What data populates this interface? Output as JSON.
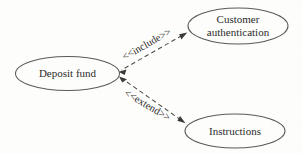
{
  "diagram": {
    "type": "uml-use-case-diagram",
    "background_color": "#fdfdfc",
    "stroke_color": "#5a5a58",
    "text_color": "#2b2b2b",
    "use_cases": [
      {
        "id": "deposit-fund",
        "label": "Deposit fund",
        "lines": [
          "Deposit fund"
        ],
        "cx": 67.5,
        "cy": 73.5,
        "rx": 52,
        "ry": 17
      },
      {
        "id": "customer-authentication",
        "label": "Customer authentication",
        "lines": [
          "Customer",
          "authentication"
        ],
        "cx": 238,
        "cy": 26,
        "rx": 50,
        "ry": 18
      },
      {
        "id": "instructions",
        "label": "Instructions",
        "lines": [
          "Instructions"
        ],
        "cx": 235,
        "cy": 131,
        "rx": 50,
        "ry": 17
      }
    ],
    "relationships": [
      {
        "id": "include-relationship",
        "stereotype": "<<include>>",
        "from": "customer-authentication",
        "to": "deposit-fund",
        "x1": 188,
        "y1": 32,
        "x2": 118,
        "y2": 72,
        "label_x": 146,
        "label_y": 45,
        "label_rotation": -30
      },
      {
        "id": "extend-relationship",
        "stereotype": "<<extend>>",
        "from": "instructions",
        "to": "deposit-fund",
        "x1": 186,
        "y1": 123,
        "x2": 119,
        "y2": 78,
        "label_x": 146,
        "label_y": 107,
        "label_rotation": 32
      }
    ]
  }
}
